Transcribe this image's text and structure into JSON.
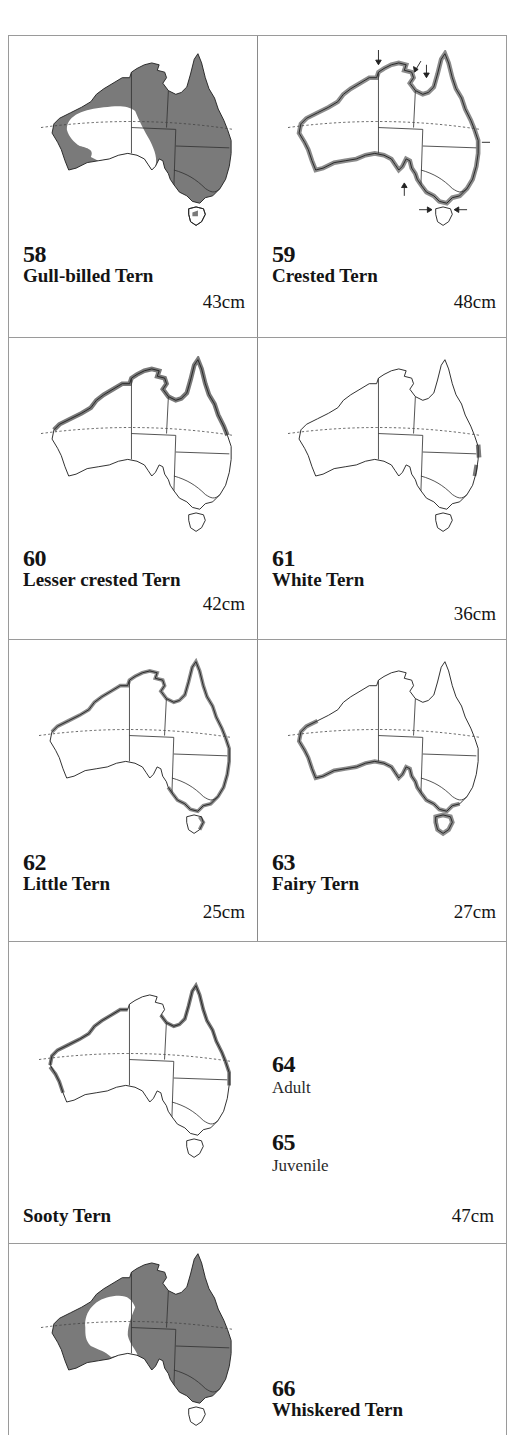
{
  "page": {
    "border_color": "#9a9a9a",
    "range_fill": "#7a7a7a",
    "coast_band": "#8c8c8c"
  },
  "entries": [
    {
      "number": "58",
      "name": "Gull-billed Tern",
      "size": "43cm",
      "range": "inland-east-west"
    },
    {
      "number": "59",
      "name": "Crested Tern",
      "size": "48cm",
      "range": "all-coast-with-arrows"
    },
    {
      "number": "60",
      "name": "Lesser crested Tern",
      "size": "42cm",
      "range": "north-coast"
    },
    {
      "number": "61",
      "name": "White Tern",
      "size": "36cm",
      "range": "east-coast-patch"
    },
    {
      "number": "62",
      "name": "Little Tern",
      "size": "25cm",
      "range": "north-east-south-coast"
    },
    {
      "number": "63",
      "name": "Fairy Tern",
      "size": "27cm",
      "range": "west-south-coast-tasmania"
    }
  ],
  "sooty": {
    "name": "Sooty Tern",
    "size": "47cm",
    "adult": {
      "number": "64",
      "label": "Adult"
    },
    "juvenile": {
      "number": "65",
      "label": "Juvenile"
    }
  },
  "whiskered": {
    "number": "66",
    "name": "Whiskered Tern"
  }
}
